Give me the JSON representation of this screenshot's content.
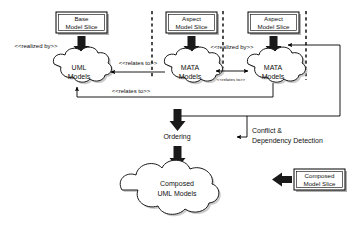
{
  "diagram": {
    "colors": {
      "stroke": "#000000",
      "fill": "#ffffff",
      "shadow": "#b0b0b0",
      "text": "#111111"
    },
    "slices": [
      {
        "id": "base-model-slice",
        "line1": "Base",
        "line2": "Model Slice"
      },
      {
        "id": "aspect-model-slice-1",
        "line1": "Aspect",
        "line2": "Model Slice"
      },
      {
        "id": "aspect-model-slice-2",
        "line1": "Aspect",
        "line2": "Model Slice"
      },
      {
        "id": "composed-model-slice",
        "line1": "Composed",
        "line2": "Model Slice"
      }
    ],
    "clouds": [
      {
        "id": "uml-models",
        "line1": "UML",
        "line2": "Models"
      },
      {
        "id": "mata-models-1",
        "line1": "MATA",
        "line2": "Models"
      },
      {
        "id": "mata-models-2",
        "line1": "MATA",
        "line2": "Models"
      },
      {
        "id": "composed-uml-models",
        "line1": "Composed",
        "line2": "UML Models"
      }
    ],
    "stereotypes": {
      "realized_by_left": "<<realized by>>",
      "realized_by_middle": "<<realized by>>",
      "relates_to_top": "<<relates to>>",
      "relates_to_middle": "<<relates to>>",
      "relates_to_bottom": "<<relates to>>"
    },
    "process_steps": [
      {
        "id": "ordering",
        "label": "Ordering"
      },
      {
        "id": "conflict-dependency-detection",
        "line1": "Conflict &",
        "line2": "Dependency Detection"
      }
    ]
  }
}
